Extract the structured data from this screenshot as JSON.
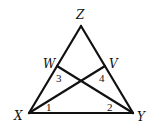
{
  "diagram": {
    "title": "",
    "type": "triangle-with-cevians",
    "points": {
      "Z": {
        "label": "Z",
        "x": 81,
        "y": 26,
        "lx": 80,
        "ly": 15
      },
      "X": {
        "label": "X",
        "x": 29,
        "y": 113,
        "lx": 20,
        "ly": 118
      },
      "Y": {
        "label": "Y",
        "x": 133,
        "y": 113,
        "lx": 141,
        "ly": 119
      },
      "W": {
        "label": "W",
        "x": 57,
        "y": 66,
        "lx": 50,
        "ly": 65
      },
      "V": {
        "label": "V",
        "x": 105,
        "y": 66,
        "lx": 113,
        "ly": 65
      }
    },
    "segments": [
      [
        "X",
        "Y"
      ],
      [
        "X",
        "Z"
      ],
      [
        "Y",
        "Z"
      ],
      [
        "X",
        "V"
      ],
      [
        "Y",
        "W"
      ]
    ],
    "angles": [
      {
        "label": "1",
        "x": 49,
        "y": 110
      },
      {
        "label": "2",
        "x": 110,
        "y": 110
      },
      {
        "label": "3",
        "x": 58,
        "y": 80
      },
      {
        "label": "4",
        "x": 101,
        "y": 80
      }
    ],
    "colors": {
      "stroke": "#111111",
      "background": "#ffffff"
    }
  }
}
